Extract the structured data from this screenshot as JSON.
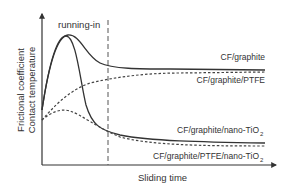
{
  "diagram": {
    "y_axis_label_line1": "Frictional coefficient",
    "y_axis_label_line2": "Contact temperature",
    "x_axis_label": "Sliding time",
    "phase_label": "running-in",
    "curves": [
      {
        "label": "CF/graphite",
        "style": "solid"
      },
      {
        "label": "CF/graphite/PTFE",
        "style": "dotted"
      },
      {
        "label": "CF/graphite/nano-TiO",
        "subscript": "2",
        "style": "solid"
      },
      {
        "label": "CF/graphite/PTFE/nano-TiO",
        "subscript": "2",
        "style": "dotted"
      }
    ],
    "colors": {
      "line": "#333333",
      "text": "#333333",
      "background": "#ffffff"
    }
  }
}
